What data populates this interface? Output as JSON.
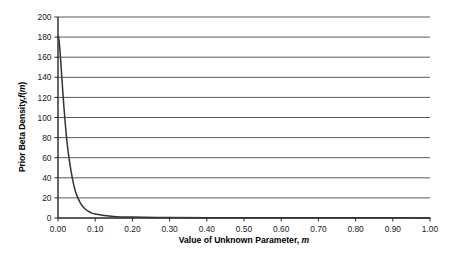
{
  "chart_data": {
    "type": "line",
    "title": "",
    "xlabel_plain": "Value of Unknown Parameter, m",
    "xlabel_prefix": "Value of Unknown Parameter, ",
    "xlabel_symbol": "m",
    "ylabel_plain": "Prior Beta Density, f(m)",
    "ylabel_prefix": "Prior Beta Density, ",
    "ylabel_f": "f",
    "ylabel_paren_open": "(",
    "ylabel_m": "m",
    "ylabel_paren_close": ")",
    "xlim": [
      0.0,
      1.0
    ],
    "ylim": [
      0,
      200
    ],
    "xticks": [
      0.0,
      0.1,
      0.2,
      0.3,
      0.4,
      0.5,
      0.6,
      0.7,
      0.8,
      0.9,
      1.0
    ],
    "xtick_labels": [
      "0.00",
      "0.10",
      "0.20",
      "0.30",
      "0.40",
      "0.50",
      "0.60",
      "0.70",
      "0.80",
      "0.90",
      "1.00"
    ],
    "yticks": [
      0,
      20,
      40,
      60,
      80,
      100,
      120,
      140,
      160,
      180,
      200
    ],
    "ytick_labels": [
      "0",
      "20",
      "40",
      "60",
      "80",
      "100",
      "120",
      "140",
      "160",
      "180",
      "200"
    ],
    "grid": "horizontal",
    "legend": "none",
    "series": [
      {
        "name": "Prior Beta Density",
        "color": "#333333",
        "x": [
          0.0,
          0.0015,
          0.003,
          0.005,
          0.007,
          0.009,
          0.011,
          0.013,
          0.016,
          0.019,
          0.022,
          0.025,
          0.028,
          0.031,
          0.035,
          0.04,
          0.045,
          0.05,
          0.06,
          0.07,
          0.085,
          0.1,
          0.15,
          0.2,
          0.3,
          0.4,
          0.5,
          0.6,
          0.7,
          0.8,
          0.9,
          1.0
        ],
        "y": [
          181,
          180,
          176,
          168,
          158,
          147,
          136,
          125,
          110,
          96,
          84,
          73,
          64,
          56,
          47,
          37,
          29,
          23,
          15,
          10,
          6,
          4,
          1.6,
          0.9,
          0.5,
          0.3,
          0.25,
          0.2,
          0.2,
          0.15,
          0.15,
          0.1
        ]
      }
    ]
  },
  "colors": {
    "grid": "#595959",
    "axis": "#262626",
    "curve": "#333333",
    "text": "#1a1a1a",
    "background": "#ffffff"
  },
  "geometry": {
    "plot_left": 58,
    "plot_right": 430,
    "plot_top": 17,
    "plot_bottom": 218
  }
}
